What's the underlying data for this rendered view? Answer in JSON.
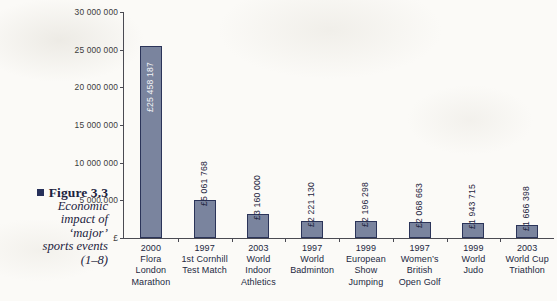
{
  "figure": {
    "bullet_color": "#26305a",
    "title": "Figure 3.3",
    "caption_lines": [
      "Economic",
      "impact of",
      "‘major’",
      "sports events",
      "(1–8)"
    ]
  },
  "chart_data": {
    "type": "bar",
    "title": "",
    "xlabel": "",
    "ylabel": "£",
    "ylim": [
      0,
      30000000
    ],
    "grid": false,
    "legend": "none",
    "currency_symbol": "£",
    "ytick_labels": [
      "£",
      "5 000 000",
      "10 000 000",
      "15 000 000",
      "20 000 000",
      "25 000 000",
      "30 000 000"
    ],
    "ytick_values": [
      0,
      5000000,
      10000000,
      15000000,
      20000000,
      25000000,
      30000000
    ],
    "categories": [
      "2000 Flora London Marathon",
      "1997 1st Cornhill Test Match",
      "2003 World Indoor Athletics",
      "1997 World Badminton",
      "1999 European Show Jumping",
      "1997 Women’s British Open Golf",
      "1999 World Judo",
      "2003 World Cup Triathlon"
    ],
    "values": [
      25458187,
      5061768,
      3160000,
      2221130,
      2196298,
      2068663,
      1943715,
      1666398
    ],
    "value_labels": [
      "£25 458 187",
      "£5 061 768",
      "£3 160 000",
      "£2 221 130",
      "£2 196 298",
      "£2 068 663",
      "£1 943 715",
      "£1 666 398"
    ],
    "bars": [
      {
        "year": "2000",
        "name_lines": [
          "Flora",
          "London",
          "Marathon"
        ],
        "value": 25458187,
        "label": "£25 458 187",
        "label_inside": true
      },
      {
        "year": "1997",
        "name_lines": [
          "1st Cornhill",
          "Test Match"
        ],
        "value": 5061768,
        "label": "£5 061 768",
        "label_inside": false
      },
      {
        "year": "2003",
        "name_lines": [
          "World",
          "Indoor",
          "Athletics"
        ],
        "value": 3160000,
        "label": "£3 160 000",
        "label_inside": false
      },
      {
        "year": "1997",
        "name_lines": [
          "World",
          "Badminton"
        ],
        "value": 2221130,
        "label": "£2 221 130",
        "label_inside": false
      },
      {
        "year": "1999",
        "name_lines": [
          "European",
          "Show",
          "Jumping"
        ],
        "value": 2196298,
        "label": "£2 196 298",
        "label_inside": false
      },
      {
        "year": "1997",
        "name_lines": [
          "Women’s",
          "British",
          "Open Golf"
        ],
        "value": 2068663,
        "label": "£2 068 663",
        "label_inside": false
      },
      {
        "year": "1999",
        "name_lines": [
          "World",
          "Judo"
        ],
        "value": 1943715,
        "label": "£1 943 715",
        "label_inside": false
      },
      {
        "year": "2003",
        "name_lines": [
          "World Cup",
          "Triathlon"
        ],
        "value": 1666398,
        "label": "£1 666 398",
        "label_inside": false
      }
    ],
    "bar_fill_color": "#7a849e",
    "bar_border_color": "#2b3459",
    "axis_color": "#4a4a52"
  }
}
